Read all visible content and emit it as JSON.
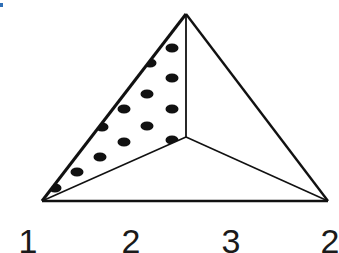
{
  "figure": {
    "vertices": {
      "apex": [
        186,
        14
      ],
      "inner": [
        186,
        137
      ],
      "left": [
        42,
        201
      ],
      "right": [
        328,
        201
      ]
    },
    "dotted_face": "left",
    "dots": [
      [
        172,
        48
      ],
      [
        150,
        63
      ],
      [
        172,
        78
      ],
      [
        147,
        94
      ],
      [
        124,
        109
      ],
      [
        172,
        109
      ],
      [
        102,
        127
      ],
      [
        147,
        126
      ],
      [
        124,
        142
      ],
      [
        172,
        140
      ],
      [
        100,
        157
      ],
      [
        77,
        172
      ],
      [
        55,
        188
      ]
    ],
    "colors": {
      "line": "#111111",
      "dot": "#111111",
      "background": "#ffffff",
      "corner_mark": "#2f6fb6"
    }
  },
  "labels": [
    {
      "text": "1",
      "x": 28
    },
    {
      "text": "2",
      "x": 131
    },
    {
      "text": "3",
      "x": 231
    },
    {
      "text": "2",
      "x": 330
    }
  ]
}
